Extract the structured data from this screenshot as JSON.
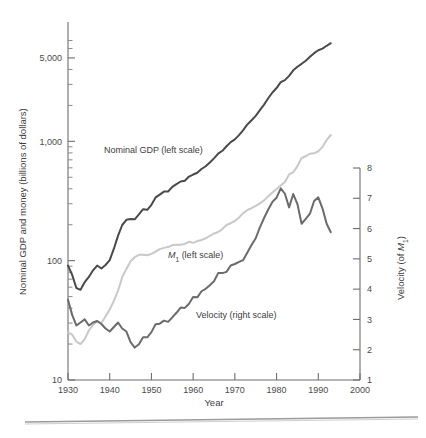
{
  "figure": {
    "background": "#ffffff",
    "width": 426,
    "height": 438
  },
  "chart_data": {
    "type": "line",
    "title": "",
    "xlabel": "Year",
    "ylabel": "Nominal GDP and money (billions of dollars)",
    "y2label": "Velocity (of M₁)",
    "grid": false,
    "legend_position": "inline-annotations",
    "x_scale": "linear",
    "y_scale": "log",
    "y2_scale": "linear",
    "xlim": [
      1930,
      2000
    ],
    "ylim": [
      10,
      10000
    ],
    "y2lim": [
      1,
      8
    ],
    "xticks": [
      1930,
      1940,
      1950,
      1960,
      1970,
      1980,
      1990,
      2000
    ],
    "xticklabels": [
      "1930",
      "1940",
      "1950",
      "1960",
      "1970",
      "1980",
      "1990",
      "2000"
    ],
    "yticks_major": [
      10,
      100,
      1000,
      5000
    ],
    "yticklabels": [
      "10",
      "100",
      "1,000",
      "5,000"
    ],
    "yticks_minor": [
      20,
      30,
      40,
      50,
      60,
      70,
      80,
      90,
      200,
      300,
      400,
      500,
      600,
      700,
      800,
      900,
      2000,
      3000,
      4000,
      6000,
      7000
    ],
    "y2ticks": [
      1,
      2,
      3,
      4,
      5,
      6,
      7,
      8
    ],
    "y2ticklabels": [
      "1",
      "2",
      "3",
      "4",
      "5",
      "6",
      "7",
      "8"
    ],
    "annotations": [
      {
        "name": "nominal-gdp-label",
        "text": "Nominal GDP (left scale)",
        "x": 1938.5,
        "y_px": 150
      },
      {
        "name": "m1-label",
        "text": "M",
        "sub": "1",
        "suffix": " (left scale)",
        "x": 1951.5,
        "y_px": 255
      },
      {
        "name": "velocity-label",
        "text": "Velocity (right scale)",
        "x": 1957,
        "y_px": 315
      }
    ],
    "series": [
      {
        "name": "Nominal GDP (left scale)",
        "axis": "left",
        "color": "#4a4a4a",
        "width": 2.0,
        "x": [
          1930,
          1931,
          1932,
          1933,
          1934,
          1935,
          1936,
          1937,
          1938,
          1939,
          1940,
          1941,
          1942,
          1943,
          1944,
          1945,
          1946,
          1947,
          1948,
          1949,
          1950,
          1951,
          1952,
          1953,
          1954,
          1955,
          1956,
          1957,
          1958,
          1959,
          1960,
          1961,
          1962,
          1963,
          1964,
          1965,
          1966,
          1967,
          1968,
          1969,
          1970,
          1971,
          1972,
          1973,
          1974,
          1975,
          1976,
          1977,
          1978,
          1979,
          1980,
          1981,
          1982,
          1983,
          1984,
          1985,
          1986,
          1987,
          1988,
          1989,
          1990,
          1991,
          1992,
          1993
        ],
        "y": [
          91,
          76,
          59,
          57,
          66,
          73,
          83,
          91,
          86,
          92,
          101,
          126,
          162,
          199,
          220,
          223,
          222,
          244,
          270,
          267,
          294,
          339,
          358,
          379,
          380,
          415,
          438,
          461,
          467,
          507,
          527,
          545,
          586,
          618,
          664,
          720,
          788,
          833,
          910,
          985,
          1039,
          1128,
          1241,
          1386,
          1501,
          1635,
          1824,
          2031,
          2295,
          2566,
          2796,
          3131,
          3259,
          3535,
          3933,
          4220,
          4463,
          4739,
          5104,
          5484,
          5803,
          5986,
          6319,
          6642
        ]
      },
      {
        "name": "M1 (left scale)",
        "axis": "left",
        "color": "#c8c8c8",
        "width": 2.0,
        "x": [
          1930,
          1931,
          1932,
          1933,
          1934,
          1935,
          1936,
          1937,
          1938,
          1939,
          1940,
          1941,
          1942,
          1943,
          1944,
          1945,
          1946,
          1947,
          1948,
          1949,
          1950,
          1951,
          1952,
          1953,
          1954,
          1955,
          1956,
          1957,
          1958,
          1959,
          1960,
          1961,
          1962,
          1963,
          1964,
          1965,
          1966,
          1967,
          1968,
          1969,
          1970,
          1971,
          1972,
          1973,
          1974,
          1975,
          1976,
          1977,
          1978,
          1979,
          1980,
          1981,
          1982,
          1983,
          1984,
          1985,
          1986,
          1987,
          1988,
          1989,
          1990,
          1991,
          1992,
          1993
        ],
        "y": [
          25,
          24,
          21,
          20,
          22,
          26,
          29,
          31,
          30,
          34,
          39,
          46,
          56,
          73,
          85,
          99,
          107,
          112,
          112,
          111,
          114,
          119,
          125,
          128,
          130,
          135,
          136,
          136,
          138,
          144,
          141,
          146,
          149,
          154,
          161,
          169,
          174,
          184,
          199,
          206,
          215,
          230,
          250,
          266,
          275,
          288,
          302,
          320,
          346,
          373,
          398,
          427,
          456,
          528,
          551,
          620,
          725,
          750,
          787,
          794,
          826,
          898,
          1025,
          1130
        ]
      },
      {
        "name": "Velocity (right scale)",
        "axis": "right",
        "color": "#6b6b6b",
        "width": 2.0,
        "x": [
          1930,
          1931,
          1932,
          1933,
          1934,
          1935,
          1936,
          1937,
          1938,
          1939,
          1940,
          1941,
          1942,
          1943,
          1944,
          1945,
          1946,
          1947,
          1948,
          1949,
          1950,
          1951,
          1952,
          1953,
          1954,
          1955,
          1956,
          1957,
          1958,
          1959,
          1960,
          1961,
          1962,
          1963,
          1964,
          1965,
          1966,
          1967,
          1968,
          1969,
          1970,
          1971,
          1972,
          1973,
          1974,
          1975,
          1976,
          1977,
          1978,
          1979,
          1980,
          1981,
          1982,
          1983,
          1984,
          1985,
          1986,
          1987,
          1988,
          1989,
          1990,
          1991,
          1992,
          1993
        ],
        "y": [
          3.65,
          3.15,
          2.8,
          2.9,
          3.0,
          2.8,
          2.9,
          2.95,
          2.85,
          2.7,
          2.6,
          2.75,
          2.9,
          2.7,
          2.6,
          2.25,
          2.07,
          2.18,
          2.41,
          2.41,
          2.58,
          2.84,
          2.86,
          2.96,
          2.92,
          3.07,
          3.22,
          3.39,
          3.38,
          3.52,
          3.74,
          3.73,
          3.93,
          4.01,
          4.13,
          4.26,
          4.53,
          4.53,
          4.57,
          4.78,
          4.83,
          4.9,
          4.96,
          5.21,
          5.46,
          5.68,
          6.04,
          6.35,
          6.63,
          6.88,
          7.02,
          7.33,
          7.15,
          6.7,
          7.14,
          6.81,
          6.16,
          6.32,
          6.49,
          6.91,
          7.03,
          6.67,
          6.16,
          5.88
        ]
      }
    ]
  }
}
